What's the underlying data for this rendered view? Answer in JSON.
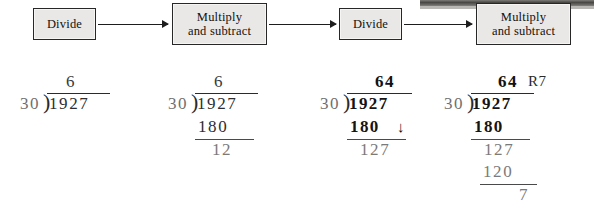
{
  "figure": {
    "background": "#ffffff"
  },
  "flowchart": {
    "steps": [
      {
        "id": "step-1",
        "label_line1": "Divide",
        "label_line2": ""
      },
      {
        "id": "step-2",
        "label_line1": "Multiply",
        "label_line2": "and subtract"
      },
      {
        "id": "step-3",
        "label_line1": "Divide",
        "label_line2": ""
      },
      {
        "id": "step-4",
        "label_line1": "Multiply",
        "label_line2": "and subtract"
      }
    ],
    "box_fill": "#e9e8e6",
    "box_border": "#272727",
    "arrow_color": "#1d1d1d"
  },
  "problems": [
    {
      "id": "problem-1",
      "quotient": "6",
      "remainder_label": "",
      "divisor": "30",
      "dividend": "1927",
      "lines": []
    },
    {
      "id": "problem-2",
      "quotient": "6",
      "remainder_label": "",
      "divisor": "30",
      "dividend": "1927",
      "lines": [
        {
          "value": "180",
          "underline": true
        },
        {
          "value": "12",
          "underline": false
        }
      ]
    },
    {
      "id": "problem-3",
      "quotient": "64",
      "remainder_label": "",
      "divisor": "30",
      "dividend": "1927",
      "bring_down": "↓",
      "lines": [
        {
          "value": "180",
          "underline": true
        },
        {
          "value": "127",
          "underline": false
        }
      ]
    },
    {
      "id": "problem-4",
      "quotient": "64",
      "remainder_label": "R7",
      "divisor": "30",
      "dividend": "1927",
      "lines": [
        {
          "value": "180",
          "underline": true
        },
        {
          "value": "127",
          "underline": false
        },
        {
          "value": "120",
          "underline": true
        },
        {
          "value": "7",
          "underline": false
        }
      ]
    }
  ]
}
